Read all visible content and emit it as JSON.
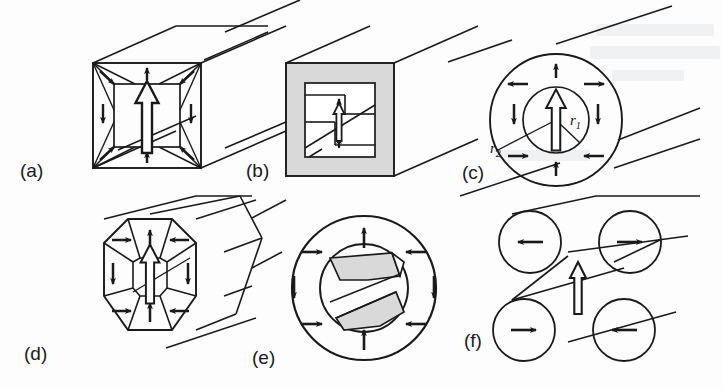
{
  "figure": {
    "width": 723,
    "height": 389,
    "background_color": "#fdfdfd",
    "ink_color": "#1a1a1a",
    "shade_color": "#d9d9d9"
  },
  "panels": [
    {
      "id": "a",
      "label": "(a)",
      "shape": "square-prism",
      "cross_section": "square",
      "shaded": false,
      "core_arrow": {
        "direction": "up",
        "style": "hollow",
        "size": "large"
      },
      "domain_arrows": [
        {
          "position": "top",
          "direction": "up"
        },
        {
          "position": "bottom",
          "direction": "up"
        },
        {
          "position": "left",
          "direction": "down"
        },
        {
          "position": "right",
          "direction": "down"
        },
        {
          "position": "top-left",
          "direction": "down-right"
        },
        {
          "position": "top-right",
          "direction": "down-left"
        },
        {
          "position": "bottom-left",
          "direction": "up-right"
        },
        {
          "position": "bottom-right",
          "direction": "up-left"
        }
      ],
      "label_x": 20,
      "label_y": 160
    },
    {
      "id": "b",
      "label": "(b)",
      "shape": "square-prism",
      "cross_section": "square",
      "shaded": true,
      "core_arrow": {
        "direction": "up",
        "style": "hollow",
        "size": "small"
      },
      "domain_arrows": [
        {
          "position": "upper-center",
          "direction": "up"
        },
        {
          "position": "lower-center",
          "direction": "up"
        }
      ],
      "label_x": 246,
      "label_y": 160
    },
    {
      "id": "c",
      "label": "(c)",
      "shape": "cylinder",
      "cross_section": "circle-annulus",
      "shaded": false,
      "core_arrow": {
        "direction": "up",
        "style": "hollow",
        "size": "large"
      },
      "radius_labels": [
        {
          "text": "r",
          "sub": "1",
          "x": 570,
          "y": 118
        },
        {
          "text": "r",
          "sub": "2",
          "x": 492,
          "y": 146
        }
      ],
      "domain_arrows": [
        {
          "position": "top",
          "direction": "up"
        },
        {
          "position": "bottom",
          "direction": "up"
        },
        {
          "position": "left",
          "direction": "left"
        },
        {
          "position": "right",
          "direction": "right"
        },
        {
          "position": "upper-left",
          "direction": "left"
        },
        {
          "position": "upper-right",
          "direction": "right"
        },
        {
          "position": "lower-left",
          "direction": "right"
        },
        {
          "position": "lower-right",
          "direction": "left"
        }
      ],
      "label_x": 462,
      "label_y": 162
    },
    {
      "id": "d",
      "label": "(d)",
      "shape": "octagonal-prism",
      "cross_section": "octagon",
      "shaded": false,
      "core_arrow": {
        "direction": "up",
        "style": "hollow",
        "size": "large"
      },
      "domain_arrows": [
        {
          "position": "top",
          "direction": "up"
        },
        {
          "position": "bottom",
          "direction": "up"
        },
        {
          "position": "upper-left",
          "direction": "right"
        },
        {
          "position": "upper-right",
          "direction": "left"
        },
        {
          "position": "left",
          "direction": "down"
        },
        {
          "position": "right",
          "direction": "down"
        },
        {
          "position": "lower-left",
          "direction": "right"
        },
        {
          "position": "lower-right",
          "direction": "left"
        }
      ],
      "label_x": 24,
      "label_y": 343
    },
    {
      "id": "e",
      "label": "(e)",
      "shape": "cylinder",
      "cross_section": "circle-annulus",
      "shaded": true,
      "core_arrow": {
        "direction": "none",
        "style": "none",
        "size": "none"
      },
      "domain_arrows": [
        {
          "position": "top",
          "direction": "up"
        },
        {
          "position": "bottom",
          "direction": "up"
        },
        {
          "position": "upper-left",
          "direction": "right"
        },
        {
          "position": "upper-right",
          "direction": "left"
        },
        {
          "position": "left",
          "direction": "down"
        },
        {
          "position": "right",
          "direction": "down"
        },
        {
          "position": "lower-left",
          "direction": "right"
        },
        {
          "position": "lower-right",
          "direction": "left"
        }
      ],
      "label_x": 252,
      "label_y": 347
    },
    {
      "id": "f",
      "label": "(f)",
      "shape": "four-cylinder-bundle",
      "cross_section": "four-circles",
      "shaded": false,
      "core_arrow": {
        "direction": "up",
        "style": "hollow",
        "size": "medium"
      },
      "domain_arrows": [
        {
          "position": "upper-left-circle",
          "direction": "left"
        },
        {
          "position": "upper-right-circle",
          "direction": "right"
        },
        {
          "position": "lower-left-circle",
          "direction": "right"
        },
        {
          "position": "lower-right-circle",
          "direction": "left"
        }
      ],
      "label_x": 464,
      "label_y": 330
    }
  ],
  "bleed_through": [
    {
      "text": "contents",
      "x": 600,
      "y": 34,
      "size": 15
    },
    {
      "text": "of  the  reverse",
      "x": 596,
      "y": 56,
      "size": 17
    },
    {
      "text": "page",
      "x": 616,
      "y": 78,
      "size": 14
    }
  ]
}
